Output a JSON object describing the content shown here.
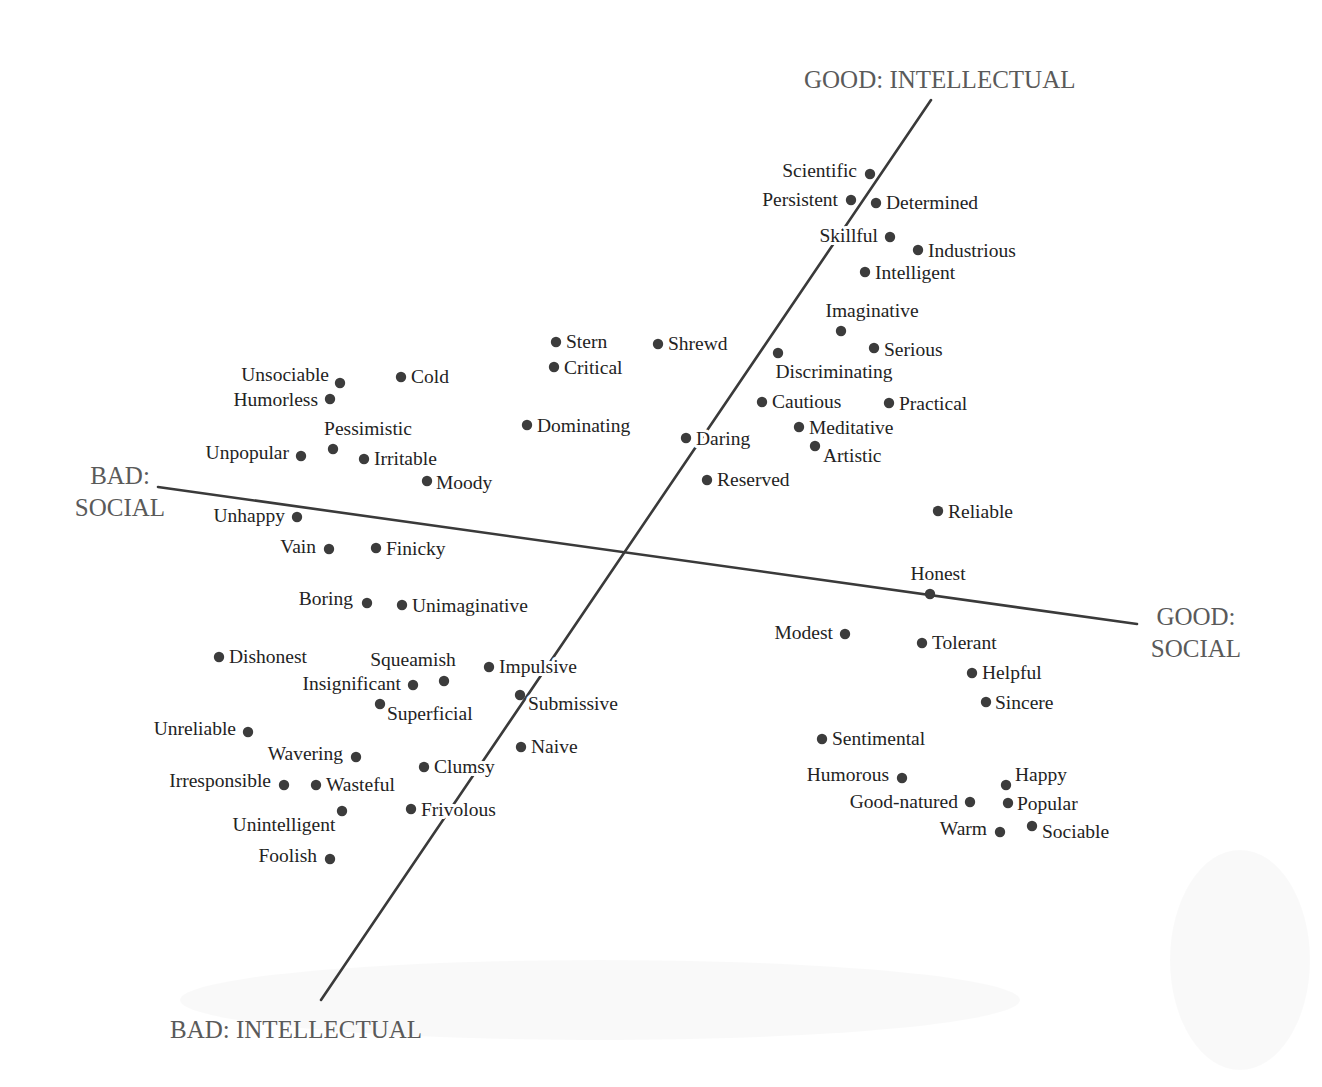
{
  "chart_data": {
    "type": "scatter",
    "title": "",
    "axes": [
      {
        "name": "intellectual",
        "positive_label": "GOOD: INTELLECTUAL",
        "negative_label": "BAD: INTELLECTUAL",
        "line": {
          "x1": 931,
          "y1": 100,
          "x2": 321,
          "y2": 1000
        }
      },
      {
        "name": "social",
        "positive_label_lines": [
          "GOOD:",
          "SOCIAL"
        ],
        "negative_label_lines": [
          "BAD:",
          "SOCIAL"
        ],
        "line": {
          "x1": 158,
          "y1": 487,
          "x2": 1137,
          "y2": 624
        }
      }
    ],
    "axis_labels": [
      {
        "id": "good-intellectual",
        "lines": [
          "GOOD: INTELLECTUAL"
        ],
        "x": 804,
        "y": 88
      },
      {
        "id": "bad-intellectual",
        "lines": [
          "BAD: INTELLECTUAL"
        ],
        "x": 170,
        "y": 1038
      },
      {
        "id": "bad-social",
        "lines": [
          "BAD:",
          "SOCIAL"
        ],
        "x": 73,
        "y": 484,
        "line_height": 32,
        "anchor": "middle",
        "cx": 120
      },
      {
        "id": "good-social",
        "lines": [
          "GOOD:",
          "SOCIAL"
        ],
        "x": 1148,
        "y": 625,
        "line_height": 32,
        "anchor": "middle",
        "cx": 1196
      }
    ],
    "points": [
      {
        "label": "Scientific",
        "x": 870,
        "y": 174,
        "lx": 857,
        "ly": 177,
        "anchor": "end"
      },
      {
        "label": "Persistent",
        "x": 851,
        "y": 200,
        "lx": 838,
        "ly": 206,
        "anchor": "end"
      },
      {
        "label": "Determined",
        "x": 876,
        "y": 203,
        "lx": 886,
        "ly": 209,
        "anchor": "start"
      },
      {
        "label": "Skillful",
        "x": 890,
        "y": 237,
        "lx": 878,
        "ly": 242,
        "anchor": "end"
      },
      {
        "label": "Industrious",
        "x": 918,
        "y": 250,
        "lx": 928,
        "ly": 257,
        "anchor": "start"
      },
      {
        "label": "Intelligent",
        "x": 865,
        "y": 272,
        "lx": 875,
        "ly": 279,
        "anchor": "start"
      },
      {
        "label": "Imaginative",
        "x": 841,
        "y": 331,
        "lx": 872,
        "ly": 317,
        "anchor": "middle"
      },
      {
        "label": "Serious",
        "x": 874,
        "y": 348,
        "lx": 884,
        "ly": 356,
        "anchor": "start"
      },
      {
        "label": "Discriminating",
        "x": 778,
        "y": 353,
        "lx": 834,
        "ly": 378,
        "anchor": "middle"
      },
      {
        "label": "Stern",
        "x": 556,
        "y": 342,
        "lx": 566,
        "ly": 348,
        "anchor": "start"
      },
      {
        "label": "Shrewd",
        "x": 658,
        "y": 344,
        "lx": 668,
        "ly": 350,
        "anchor": "start"
      },
      {
        "label": "Critical",
        "x": 554,
        "y": 367,
        "lx": 564,
        "ly": 374,
        "anchor": "start"
      },
      {
        "label": "Cautious",
        "x": 762,
        "y": 402,
        "lx": 772,
        "ly": 408,
        "anchor": "start"
      },
      {
        "label": "Practical",
        "x": 889,
        "y": 403,
        "lx": 899,
        "ly": 410,
        "anchor": "start"
      },
      {
        "label": "Dominating",
        "x": 527,
        "y": 425,
        "lx": 537,
        "ly": 432,
        "anchor": "start"
      },
      {
        "label": "Meditative",
        "x": 799,
        "y": 427,
        "lx": 809,
        "ly": 434,
        "anchor": "start"
      },
      {
        "label": "Daring",
        "x": 686,
        "y": 438,
        "lx": 696,
        "ly": 445,
        "anchor": "start"
      },
      {
        "label": "Artistic",
        "x": 815,
        "y": 446,
        "lx": 823,
        "ly": 462,
        "anchor": "start"
      },
      {
        "label": "Reserved",
        "x": 707,
        "y": 480,
        "lx": 717,
        "ly": 486,
        "anchor": "start"
      },
      {
        "label": "Reliable",
        "x": 938,
        "y": 511,
        "lx": 948,
        "ly": 518,
        "anchor": "start"
      },
      {
        "label": "Unsociable",
        "x": 340,
        "y": 383,
        "lx": 329,
        "ly": 381,
        "anchor": "end"
      },
      {
        "label": "Cold",
        "x": 401,
        "y": 377,
        "lx": 411,
        "ly": 383,
        "anchor": "start"
      },
      {
        "label": "Humorless",
        "x": 330,
        "y": 399,
        "lx": 318,
        "ly": 406,
        "anchor": "end"
      },
      {
        "label": "Pessimistic",
        "x": 333,
        "y": 449,
        "lx": 368,
        "ly": 435,
        "anchor": "middle"
      },
      {
        "label": "Unpopular",
        "x": 301,
        "y": 456,
        "lx": 289,
        "ly": 459,
        "anchor": "end"
      },
      {
        "label": "Irritable",
        "x": 364,
        "y": 459,
        "lx": 374,
        "ly": 465,
        "anchor": "start"
      },
      {
        "label": "Moody",
        "x": 427,
        "y": 481,
        "lx": 436,
        "ly": 489,
        "anchor": "start"
      },
      {
        "label": "Unhappy",
        "x": 297,
        "y": 517,
        "lx": 285,
        "ly": 522,
        "anchor": "end"
      },
      {
        "label": "Vain",
        "x": 329,
        "y": 549,
        "lx": 316,
        "ly": 553,
        "anchor": "end"
      },
      {
        "label": "Finicky",
        "x": 376,
        "y": 548,
        "lx": 386,
        "ly": 555,
        "anchor": "start"
      },
      {
        "label": "Boring",
        "x": 367,
        "y": 603,
        "lx": 353,
        "ly": 605,
        "anchor": "end"
      },
      {
        "label": "Unimaginative",
        "x": 402,
        "y": 605,
        "lx": 412,
        "ly": 612,
        "anchor": "start"
      },
      {
        "label": "Honest",
        "x": 930,
        "y": 594,
        "lx": 938,
        "ly": 580,
        "anchor": "middle"
      },
      {
        "label": "Modest",
        "x": 845,
        "y": 634,
        "lx": 833,
        "ly": 639,
        "anchor": "end"
      },
      {
        "label": "Tolerant",
        "x": 922,
        "y": 643,
        "lx": 932,
        "ly": 649,
        "anchor": "start"
      },
      {
        "label": "Helpful",
        "x": 972,
        "y": 673,
        "lx": 982,
        "ly": 679,
        "anchor": "start"
      },
      {
        "label": "Sincere",
        "x": 986,
        "y": 702,
        "lx": 995,
        "ly": 709,
        "anchor": "start"
      },
      {
        "label": "Dishonest",
        "x": 219,
        "y": 657,
        "lx": 229,
        "ly": 663,
        "anchor": "start"
      },
      {
        "label": "Squeamish",
        "x": 444,
        "y": 681,
        "lx": 413,
        "ly": 666,
        "anchor": "middle"
      },
      {
        "label": "Insignificant",
        "x": 413,
        "y": 685,
        "lx": 401,
        "ly": 690,
        "anchor": "end"
      },
      {
        "label": "Impulsive",
        "x": 489,
        "y": 667,
        "lx": 499,
        "ly": 673,
        "anchor": "start"
      },
      {
        "label": "Submissive",
        "x": 520,
        "y": 695,
        "lx": 528,
        "ly": 710,
        "anchor": "start"
      },
      {
        "label": "Superficial",
        "x": 380,
        "y": 704,
        "lx": 387,
        "ly": 720,
        "anchor": "start"
      },
      {
        "label": "Unreliable",
        "x": 248,
        "y": 732,
        "lx": 236,
        "ly": 735,
        "anchor": "end"
      },
      {
        "label": "Naive",
        "x": 521,
        "y": 747,
        "lx": 531,
        "ly": 753,
        "anchor": "start"
      },
      {
        "label": "Wavering",
        "x": 356,
        "y": 757,
        "lx": 343,
        "ly": 760,
        "anchor": "end"
      },
      {
        "label": "Clumsy",
        "x": 424,
        "y": 767,
        "lx": 434,
        "ly": 773,
        "anchor": "start"
      },
      {
        "label": "Irresponsible",
        "x": 284,
        "y": 785,
        "lx": 271,
        "ly": 787,
        "anchor": "end"
      },
      {
        "label": "Wasteful",
        "x": 316,
        "y": 785,
        "lx": 326,
        "ly": 791,
        "anchor": "start"
      },
      {
        "label": "Unintelligent",
        "x": 342,
        "y": 811,
        "lx": 284,
        "ly": 831,
        "anchor": "middle"
      },
      {
        "label": "Frivolous",
        "x": 411,
        "y": 809,
        "lx": 421,
        "ly": 816,
        "anchor": "start"
      },
      {
        "label": "Foolish",
        "x": 330,
        "y": 859,
        "lx": 317,
        "ly": 862,
        "anchor": "end"
      },
      {
        "label": "Sentimental",
        "x": 822,
        "y": 739,
        "lx": 832,
        "ly": 745,
        "anchor": "start"
      },
      {
        "label": "Humorous",
        "x": 902,
        "y": 778,
        "lx": 889,
        "ly": 781,
        "anchor": "end"
      },
      {
        "label": "Happy",
        "x": 1006,
        "y": 785,
        "lx": 1015,
        "ly": 781,
        "anchor": "start"
      },
      {
        "label": "Good-natured",
        "x": 970,
        "y": 802,
        "lx": 958,
        "ly": 808,
        "anchor": "end"
      },
      {
        "label": "Popular",
        "x": 1008,
        "y": 803,
        "lx": 1017,
        "ly": 810,
        "anchor": "start"
      },
      {
        "label": "Warm",
        "x": 1000,
        "y": 832,
        "lx": 987,
        "ly": 835,
        "anchor": "end"
      },
      {
        "label": "Sociable",
        "x": 1032,
        "y": 826,
        "lx": 1042,
        "ly": 838,
        "anchor": "start"
      }
    ],
    "xlabel": "",
    "ylabel": "",
    "grid": false,
    "legend": null
  },
  "colors": {
    "background": "#ffffff",
    "axis_line": "#3a3a3a",
    "axis_label": "#5a5a5a",
    "trait_label": "#232323",
    "dot": "#3c3c3c"
  }
}
